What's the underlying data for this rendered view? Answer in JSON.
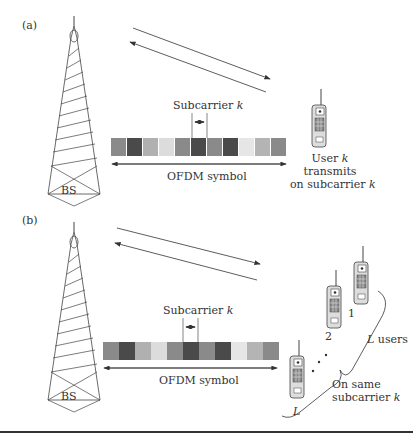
{
  "panel_a": {
    "label": "(a)",
    "bs_label": "BS",
    "subcarrier_label": "Subcarrier",
    "k": "k",
    "ofdm_label": "OFDM symbol",
    "user_line1": "User",
    "user_line2": "transmits",
    "user_line3": "on subcarrier",
    "cells": [
      "#8a8a8a",
      "#4a4a4a",
      "#b0b0b0",
      "#dcdcdc",
      "#8a8a8a",
      "#4a4a4a",
      "#8a8a8a",
      "#4a4a4a",
      "#e6e6e6",
      "#b4b4b4",
      "#8a8a8a"
    ]
  },
  "panel_b": {
    "label": "(b)",
    "bs_label": "BS",
    "subcarrier_label": "Subcarrier",
    "k": "k",
    "ofdm_label": "OFDM symbol",
    "user1": "1",
    "user2": "2",
    "userL": "L",
    "l_users": "users",
    "same1": "On same",
    "same2": "subcarrier",
    "cells": [
      "#8a8a8a",
      "#4a4a4a",
      "#b0b0b0",
      "#dcdcdc",
      "#8a8a8a",
      "#4a4a4a",
      "#8a8a8a",
      "#4a4a4a",
      "#e6e6e6",
      "#b4b4b4",
      "#8a8a8a"
    ]
  }
}
